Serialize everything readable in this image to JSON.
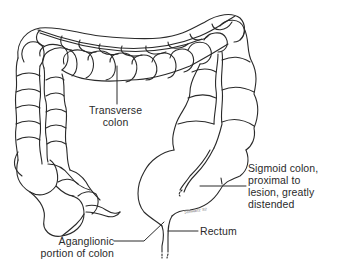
{
  "figure": {
    "colors": {
      "line": "#2a2a2a",
      "background": "#ffffff"
    }
  },
  "labels": {
    "transverse": [
      "Transverse",
      "colon"
    ],
    "sigmoid": [
      "Sigmoid colon,",
      "proximal to",
      "lesion, greatly",
      "distended"
    ],
    "rectum": "Rectum",
    "aganglionic": [
      "Aganglionic",
      "portion of colon"
    ]
  },
  "signature": "Schwartz '82"
}
